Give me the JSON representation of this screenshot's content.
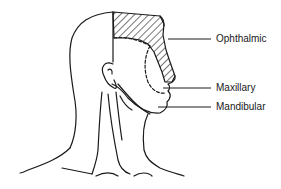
{
  "diagram": {
    "labels": [
      {
        "id": "ophthalmic",
        "text": "Ophthalmic",
        "x": 216,
        "y": 33
      },
      {
        "id": "maxillary",
        "text": "Maxillary",
        "x": 216,
        "y": 82
      },
      {
        "id": "mandibular",
        "text": "Mandibular",
        "x": 216,
        "y": 101
      }
    ],
    "colors": {
      "line": "#1a1a1a",
      "background": "#ffffff"
    }
  }
}
